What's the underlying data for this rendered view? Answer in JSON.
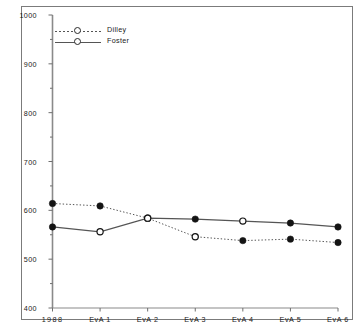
{
  "chart_data": {
    "type": "line",
    "title": "",
    "xlabel": "",
    "ylabel": "",
    "categories": [
      "1988",
      "EvA 1",
      "EvA 2",
      "EvA 3",
      "EvA 4",
      "EvA 5",
      "EvA 6"
    ],
    "series": [
      {
        "name": "Dilley",
        "linestyle": "dotted",
        "color": "#555555",
        "values": [
          614,
          609,
          584,
          546,
          538,
          541,
          534
        ],
        "marker_fill": [
          "filled",
          "filled",
          "open",
          "open",
          "filled",
          "filled",
          "filled"
        ]
      },
      {
        "name": "Foster",
        "linestyle": "solid",
        "color": "#555555",
        "values": [
          566,
          556,
          584,
          582,
          578,
          574,
          566
        ],
        "marker_fill": [
          "filled",
          "open",
          "open",
          "filled",
          "open",
          "filled",
          "filled"
        ]
      }
    ],
    "ylim": [
      400,
      1000
    ],
    "yticks": [
      400,
      500,
      600,
      700,
      800,
      900,
      1000
    ],
    "ytick_labels": [
      "400",
      "500",
      "600",
      "700",
      "800",
      "900",
      "1000"
    ],
    "yminor_ticks": [
      450,
      550,
      650,
      750,
      850,
      950
    ],
    "grid": false,
    "legend_position": "upper-left",
    "frame": "box"
  },
  "legend": {
    "entries": [
      {
        "label": "Dilley",
        "style": "dotted"
      },
      {
        "label": "Foster",
        "style": "solid"
      }
    ]
  }
}
